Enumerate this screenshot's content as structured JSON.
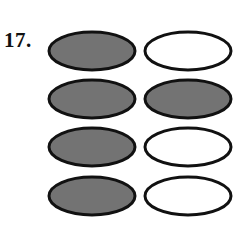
{
  "question": {
    "number_label": "17."
  },
  "colors": {
    "page_background": "#ffffff",
    "ellipse_stroke": "#111111",
    "ellipse_shaded_fill": "#737373",
    "ellipse_unshaded_fill": "#ffffff",
    "text": "#111111"
  },
  "diagram": {
    "name": "shaded-ellipse-grid",
    "rows": 4,
    "columns": 2,
    "ellipse_width": 86,
    "ellipse_height": 38,
    "stroke_width": 3,
    "row_centers_y": [
      51,
      99,
      147,
      196
    ],
    "column_centers_x": [
      93,
      189
    ],
    "cells": [
      [
        {
          "state": "shaded",
          "fill": "#737373",
          "label": "shaded-ellipse"
        },
        {
          "state": "unshaded",
          "fill": "#ffffff",
          "label": "unshaded-ellipse"
        }
      ],
      [
        {
          "state": "shaded",
          "fill": "#737373",
          "label": "shaded-ellipse"
        },
        {
          "state": "shaded",
          "fill": "#737373",
          "label": "shaded-ellipse"
        }
      ],
      [
        {
          "state": "shaded",
          "fill": "#737373",
          "label": "shaded-ellipse"
        },
        {
          "state": "unshaded",
          "fill": "#ffffff",
          "label": "unshaded-ellipse"
        }
      ],
      [
        {
          "state": "shaded",
          "fill": "#737373",
          "label": "shaded-ellipse"
        },
        {
          "state": "unshaded",
          "fill": "#ffffff",
          "label": "unshaded-ellipse"
        }
      ]
    ]
  }
}
